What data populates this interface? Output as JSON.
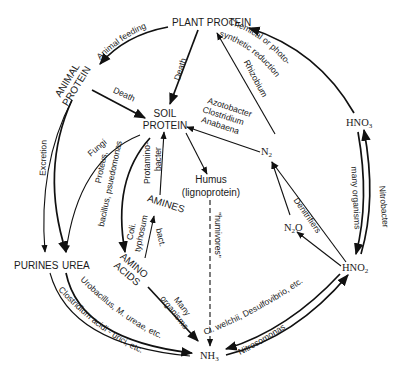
{
  "diagram": {
    "type": "nitrogen-cycle",
    "nodes": {
      "plant_protein": "PLANT PROTEIN",
      "animal_protein_1": "ANIMAL",
      "animal_protein_2": "PROTEIN",
      "soil_protein_1": "SOIL",
      "soil_protein_2": "PROTEIN",
      "humus_1": "Humus",
      "humus_2": "(lignoprotein)",
      "amines": "AMINES",
      "amino_acids_1": "AMINO",
      "amino_acids_2": "ACIDS",
      "purines": "PURINES",
      "urea": "UREA",
      "nh3": "NH",
      "nh3_sub": "3",
      "hno3": "HNO",
      "hno3_sub": "3",
      "hno2": "HNO",
      "hno2_sub": "2",
      "n2": "N",
      "n2_sub": "2",
      "n2o": "N",
      "n2o_sub": "2",
      "n2o_tail": "O"
    },
    "edge_labels": {
      "animal_feeding": "Animal feeding",
      "death_plant": "Death",
      "death_animal": "Death",
      "chemical_1": "Chemical or photo-",
      "chemical_2": "synthetic reduction",
      "rhizobium": "Rhizobium",
      "azotobacter_1": "Azotobacter",
      "azotobacter_2": "Clostridium",
      "azotobacter_3": "Anabaena",
      "excretion": "Excretion",
      "fungi": "Fungi",
      "proteus_1": "Proteus,",
      "proteus_2": "bacillus, psuedomonas",
      "protamino_1": "Protamino-",
      "protamino_2": "bacter",
      "coli_1": "Coli.",
      "coli_2": "typhosum",
      "coli_3": "bact.",
      "humivores": "\"humivores\"",
      "many_org_1": "Many",
      "many_org_2": "organisms",
      "urobacillus": "Urobacillus, M. ureae, etc.",
      "clostridium_acidi": "Clostridium acidi - urici, etc.",
      "cl_welchii": "Cl. welchii, Desulfovibrio, etc.",
      "nitrosomonas": "Nitrosomonas",
      "nitrobacter": "Nitrobacter",
      "many_organisms_right": "many organisms",
      "denitrifiers": "Denitrifiers"
    },
    "colors": {
      "ink": "#111111",
      "background": "#ffffff"
    }
  }
}
